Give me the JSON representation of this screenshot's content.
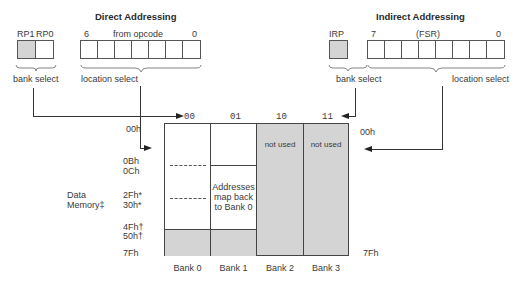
{
  "direct": {
    "title": "Direct Addressing",
    "bank_bits": [
      "RP1",
      "RP0"
    ],
    "bank_label": "RP1 RP0",
    "bit_high": "6",
    "source": "from opcode",
    "bit_low": "0",
    "bank_select": "bank select",
    "location_select": "location select"
  },
  "indirect": {
    "title": "Indirect Addressing",
    "bank_bit": "IRP",
    "bit_high": "7",
    "source": "(FSR)",
    "bit_low": "0",
    "bank_select": "bank select",
    "location_select": "location select"
  },
  "memory_map": {
    "bank_codes": [
      "00",
      "01",
      "10",
      "11"
    ],
    "banks": [
      "Bank 0",
      "Bank 1",
      "Bank 2",
      "Bank 3"
    ],
    "left_addresses": [
      "00h",
      "0Bh",
      "0Ch",
      "2Fh*",
      "30h*",
      "4Fh†",
      "50h†",
      "7Fh"
    ],
    "right_addresses": [
      "00h",
      "7Fh"
    ],
    "data_memory_label": [
      "Data",
      "Memory‡"
    ],
    "bank1_note": [
      "Addresses",
      "map back",
      "to Bank 0"
    ],
    "not_used": "not used",
    "colors": {
      "shaded": "#d4d4d4",
      "border": "#444444"
    }
  }
}
